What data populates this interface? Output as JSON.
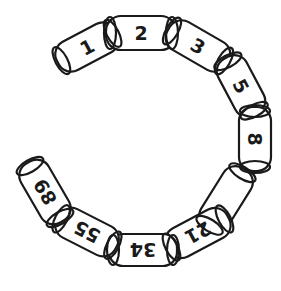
{
  "diagram": {
    "colors": {
      "stroke": "#1a1a1a",
      "fill": "#ffffff",
      "background": "#ffffff"
    },
    "links": [
      {
        "label": "1",
        "cx": 87,
        "cy": 47,
        "w": 66,
        "h": 32,
        "angle": -28,
        "text_angle": -28
      },
      {
        "label": "2",
        "cx": 141,
        "cy": 33,
        "w": 70,
        "h": 34,
        "angle": 0,
        "text_angle": 0
      },
      {
        "label": "3",
        "cx": 198,
        "cy": 46,
        "w": 68,
        "h": 32,
        "angle": 30,
        "text_angle": 30
      },
      {
        "label": "5",
        "cx": 241,
        "cy": 86,
        "w": 64,
        "h": 32,
        "angle": 62,
        "text_angle": 62
      },
      {
        "label": "8",
        "cx": 255,
        "cy": 139,
        "w": 64,
        "h": 32,
        "angle": 90,
        "text_angle": 90
      },
      {
        "label": "",
        "cx": 226,
        "cy": 199,
        "w": 70,
        "h": 32,
        "angle": 122,
        "text_angle": 122
      },
      {
        "label": "21",
        "cx": 198,
        "cy": 233,
        "w": 68,
        "h": 32,
        "angle": 152,
        "text_angle": 152
      },
      {
        "label": "34",
        "cx": 143,
        "cy": 250,
        "w": 68,
        "h": 32,
        "angle": 180,
        "text_angle": 180
      },
      {
        "label": "55",
        "cx": 87,
        "cy": 232,
        "w": 66,
        "h": 32,
        "angle": 207,
        "text_angle": 207
      },
      {
        "label": "89",
        "cx": 45,
        "cy": 192,
        "w": 68,
        "h": 32,
        "angle": 240,
        "text_angle": 240
      }
    ],
    "missing_link_value_hidden": true
  }
}
